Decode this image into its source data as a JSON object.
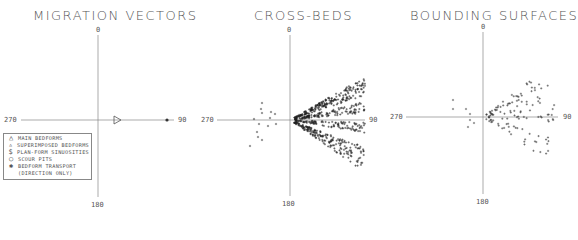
{
  "chart_data": [
    {
      "type": "scatter",
      "title": "MIGRATION VECTORS",
      "axis_labels": {
        "top": "0",
        "right": "90",
        "bottom": "180",
        "left": "270"
      },
      "grid": false,
      "points": [
        {
          "symbol": "main-bedform-triangle",
          "x": 0.25,
          "y": 0
        },
        {
          "symbol": "bedform-transport-star",
          "x": 0.95,
          "y": 0
        }
      ],
      "legend": [
        {
          "symbol": "△",
          "label": "MAIN BEDFORMS"
        },
        {
          "symbol": "▵",
          "label": "SUPERIMPOSED BEDFORMS"
        },
        {
          "symbol": "$",
          "label": "PLAN-FORM SINUOSITIES"
        },
        {
          "symbol": "○",
          "label": "SCOUR PITS"
        },
        {
          "symbol": "✱",
          "label": "BEDFORM TRANSPORT",
          "label2": "(DIRECTION ONLY)"
        }
      ]
    },
    {
      "type": "scatter",
      "title": "CROSS-BEDS",
      "axis_labels": {
        "top": "0",
        "right": "90",
        "bottom": "180",
        "left": "270"
      },
      "grid": false,
      "description": "Dense fan of + marks radiating from origin toward ~30°-150° azimuth; sparse scatter toward 240°-300°"
    },
    {
      "type": "scatter",
      "title": "BOUNDING SURFACES",
      "axis_labels": {
        "top": "0",
        "right": "90",
        "bottom": "180",
        "left": "270"
      },
      "grid": false,
      "description": "Sparser fan of + marks from origin toward ~40°-140° azimuth, a few points toward 290°"
    }
  ],
  "panels": {
    "p1": {
      "title": "MIGRATION VECTORS",
      "n": "0",
      "e": "90",
      "s": "180",
      "w": "270"
    },
    "p2": {
      "title": "CROSS-BEDS",
      "n": "0",
      "e": "90",
      "s": "180",
      "w": "270"
    },
    "p3": {
      "title": "BOUNDING SURFACES",
      "n": "0",
      "e": "90",
      "s": "180",
      "w": "270"
    }
  },
  "legend": {
    "items": [
      {
        "sym": "△",
        "label": "MAIN BEDFORMS"
      },
      {
        "sym": "▵",
        "label": "SUPERIMPOSED BEDFORMS"
      },
      {
        "sym": "$",
        "label": "PLAN-FORM SINUOSITIES"
      },
      {
        "sym": "○",
        "label": "SCOUR PITS"
      },
      {
        "sym": "✱",
        "label": "BEDFORM TRANSPORT"
      }
    ],
    "continuation": "(DIRECTION ONLY)"
  }
}
